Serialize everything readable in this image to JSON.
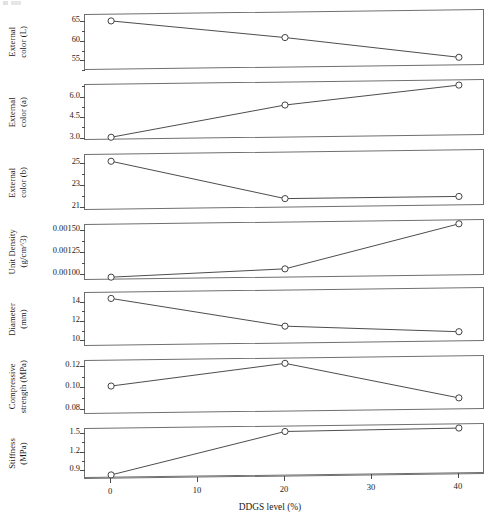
{
  "figure": {
    "xlabel": "DDGS level (%)",
    "xticks": [
      "0",
      "10",
      "20",
      "30",
      "40"
    ],
    "marker": "open-circle",
    "line_color": "#3a3a3a",
    "axis_color": "#6f6f6f"
  },
  "chart_data": {
    "type": "line",
    "title": "",
    "xlabel": "DDGS level (%)",
    "x": [
      0,
      20,
      40
    ],
    "xlim": [
      -3,
      43
    ],
    "xticks": [
      0,
      10,
      20,
      30,
      40
    ],
    "grid": false,
    "legend": "none",
    "panels": [
      {
        "ylabel": "External\ncolor (L)",
        "ylabel_lines": [
          "External",
          "color (L)"
        ],
        "yticks": [
          65,
          60,
          55
        ],
        "ytick_labels": [
          "65",
          "60",
          "55"
        ],
        "ylim": [
          52.3,
          66.6
        ],
        "values": [
          65.0,
          60.2,
          54.6
        ]
      },
      {
        "ylabel": "External\ncolor (a)",
        "ylabel_lines": [
          "External",
          "color (a)"
        ],
        "yticks": [
          6.0,
          4.5,
          3.0
        ],
        "ytick_labels": [
          "6.0",
          "4.5",
          "3.0"
        ],
        "ylim": [
          2.75,
          6.85
        ],
        "values": [
          3.0,
          5.2,
          6.5
        ]
      },
      {
        "ylabel": "External\ncolor (b)",
        "ylabel_lines": [
          "External",
          "color (b)"
        ],
        "yticks": [
          25,
          23,
          21
        ],
        "ytick_labels": [
          "25",
          "23",
          "21"
        ],
        "ylim": [
          20.6,
          25.7
        ],
        "values": [
          25.1,
          21.5,
          21.5
        ]
      },
      {
        "ylabel": "Unit Density\n(g/cm^3)",
        "ylabel_lines": [
          "Unit Density",
          "(g/cm^3)"
        ],
        "yticks": [
          0.0015,
          0.00125,
          0.001
        ],
        "ytick_labels": [
          "0.00150",
          "0.00125",
          "0.00100"
        ],
        "ylim": [
          0.00092,
          0.00156
        ],
        "values": [
          0.00096,
          0.00103,
          0.00152
        ]
      },
      {
        "ylabel": "Diameter\n(mm)",
        "ylabel_lines": [
          "Diameter",
          "(mm)"
        ],
        "yticks": [
          14,
          12,
          10
        ],
        "ytick_labels": [
          "14",
          "12",
          "10"
        ],
        "ylim": [
          9.3,
          14.9
        ],
        "values": [
          14.3,
          11.2,
          10.4
        ]
      },
      {
        "ylabel": "Compressive\nstrength (MPa)",
        "ylabel_lines": [
          "Compressive",
          "strength (MPa)"
        ],
        "yticks": [
          0.12,
          0.1,
          0.08
        ],
        "ytick_labels": [
          "0.12",
          "0.10",
          "0.08"
        ],
        "ylim": [
          0.0745,
          0.1245
        ],
        "values": [
          0.101,
          0.12,
          0.086
        ]
      },
      {
        "ylabel": "Stiffness\n(MPa)",
        "ylabel_lines": [
          "Stiffness",
          "(MPa)"
        ],
        "yticks": [
          1.5,
          1.2,
          0.9
        ],
        "ytick_labels": [
          "1.5",
          "1.2",
          "0.9"
        ],
        "ylim": [
          0.76,
          1.56
        ],
        "values": [
          0.82,
          1.48,
          1.5
        ]
      }
    ]
  }
}
